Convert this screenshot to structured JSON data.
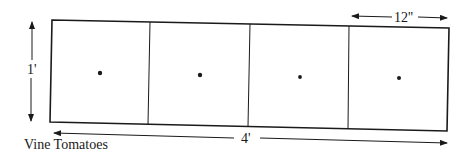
{
  "diagram": {
    "title_label": "Vine Tomatoes",
    "height_label": "1'",
    "width_label": "4'",
    "cell_width_label": "12''",
    "cells": [
      {
        "index": 1,
        "plant": "dot"
      },
      {
        "index": 2,
        "plant": "dot"
      },
      {
        "index": 3,
        "plant": "dot"
      },
      {
        "index": 4,
        "plant": "dot"
      }
    ],
    "colors": {
      "line": "#1a1a1a",
      "background": "#ffffff"
    }
  }
}
